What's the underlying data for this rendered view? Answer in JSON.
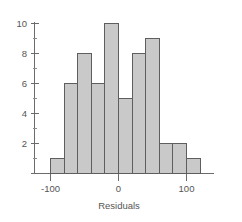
{
  "chart_data": {
    "type": "bar",
    "title": "",
    "subtitle": "",
    "xlabel": "Residuals",
    "ylabel": "",
    "categories": [
      "-110 to -90",
      "-90 to -70",
      "-70 to -50",
      "-50 to -30",
      "-30 to -10",
      "-10 to 10",
      "10 to 30",
      "30 to 50",
      "50 to 70",
      "70 to 90",
      "90 to 110"
    ],
    "bin_edges": [
      -110,
      -90,
      -70,
      -50,
      -30,
      -10,
      10,
      30,
      50,
      70,
      90,
      110
    ],
    "values": [
      1,
      6,
      8,
      6,
      10,
      5,
      8,
      9,
      2,
      2,
      1
    ],
    "xlim": [
      -130,
      130
    ],
    "ylim": [
      0,
      10.6
    ],
    "x_ticks": [
      -100,
      0,
      100
    ],
    "x_tick_labels": [
      "-100",
      "0",
      "100"
    ],
    "y_ticks": [
      2,
      4,
      6,
      8,
      10
    ],
    "y_tick_labels": [
      "2",
      "4",
      "6",
      "8",
      "10"
    ],
    "y_minor_ticks": [
      1,
      3,
      5,
      7,
      9
    ],
    "grid": false,
    "legend": null,
    "legend_position": "none",
    "bar_fill_color": "#c9c9c9",
    "bar_edge_color": "#5e5e5e",
    "axis_color": "#6b6b6b",
    "text_color": "#555555",
    "background_color": "#ffffff"
  },
  "axis": {
    "x_title": "Residuals",
    "x_labels": [
      "-100",
      "0",
      "100"
    ],
    "y_labels": [
      "10",
      "8",
      "6",
      "4",
      "2"
    ]
  }
}
